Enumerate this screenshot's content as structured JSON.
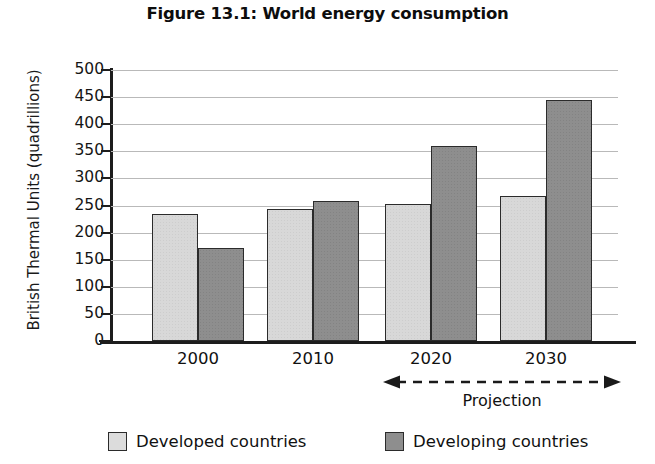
{
  "chart_data": {
    "type": "bar",
    "title": "Figure 13.1: World energy consumption",
    "xlabel": "",
    "ylabel": "British Thermal Units (quadrillions)",
    "categories": [
      "2000",
      "2010",
      "2020",
      "2030"
    ],
    "series": [
      {
        "name": "Developed countries",
        "values": [
          235,
          243,
          252,
          268
        ],
        "color": "#d8d8d8"
      },
      {
        "name": "Developing countries",
        "values": [
          172,
          258,
          360,
          445
        ],
        "color": "#8e8e8e"
      }
    ],
    "ylim": [
      0,
      500
    ],
    "ytick_labels": [
      "500",
      "450",
      "400",
      "350",
      "300",
      "250",
      "200",
      "150",
      "100",
      "50",
      "0"
    ],
    "ytick_values": [
      500,
      450,
      400,
      350,
      300,
      250,
      200,
      150,
      100,
      50,
      0
    ],
    "grid": true,
    "legend_position": "bottom",
    "annotations": [
      {
        "name": "projection-range",
        "label": "Projection",
        "spans": [
          "2020",
          "2030"
        ],
        "style": "dashed-double-arrow"
      }
    ]
  },
  "legend": {
    "items": [
      {
        "label": "Developed countries",
        "swatch": "developed"
      },
      {
        "label": "Developing countries",
        "swatch": "developing"
      }
    ]
  },
  "annotation": {
    "projection_label": "Projection"
  }
}
